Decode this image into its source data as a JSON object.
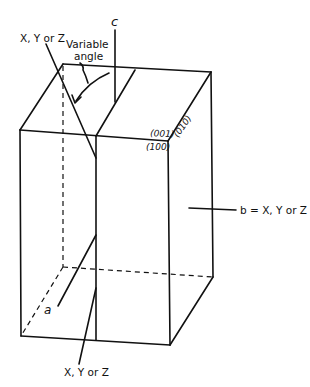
{
  "diagram": {
    "type": "crystal-orientation-block",
    "labels": {
      "c_axis": "c",
      "top_axis": "X, Y or Z",
      "variable_angle_line1": "Variable",
      "variable_angle_line2": "angle",
      "face_001": "(001)",
      "face_100": "(100)",
      "face_010": "(010)",
      "b_axis": "b = X, Y or Z",
      "a_axis": "a",
      "bottom_axis": "X, Y or Z"
    },
    "colors": {
      "line": "#111111",
      "background": "#ffffff"
    }
  }
}
